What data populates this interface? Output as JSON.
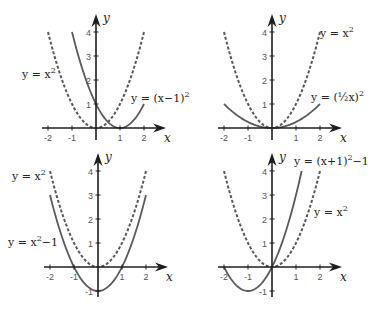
{
  "chart_data": [
    {
      "type": "line",
      "panel": "top-left",
      "origin_px": [
        96,
        128
      ],
      "unit_px": 24,
      "xlabel": "x",
      "ylabel": "y",
      "xlim": [
        -2,
        2
      ],
      "ylim": [
        0,
        4
      ],
      "x_ticks": [
        -2,
        -1,
        1,
        2
      ],
      "y_ticks": [
        1,
        2,
        3,
        4
      ],
      "series": [
        {
          "name": "y = x²",
          "style": "dashed",
          "expr": "x^2",
          "x_range": [
            -2,
            2
          ]
        },
        {
          "name": "y = (x−1)²",
          "style": "solid",
          "expr": "(x-1)^2",
          "x_range": [
            -1,
            2
          ]
        }
      ],
      "labels": [
        {
          "text": "y = x",
          "sup": "2",
          "x": 22,
          "y": 78
        },
        {
          "text": "y = (x−1)",
          "sup": "2",
          "x": 131,
          "y": 102
        }
      ]
    },
    {
      "type": "line",
      "panel": "top-right",
      "origin_px": [
        272,
        128
      ],
      "unit_px": 24,
      "xlabel": "x",
      "ylabel": "y",
      "xlim": [
        -2,
        2
      ],
      "ylim": [
        0,
        4
      ],
      "x_ticks": [
        -2,
        -1,
        1,
        2
      ],
      "y_ticks": [
        1,
        2,
        3,
        4
      ],
      "series": [
        {
          "name": "y = x²",
          "style": "dashed",
          "expr": "x^2",
          "x_range": [
            -2,
            2
          ]
        },
        {
          "name": "y = (½x)²",
          "style": "solid",
          "expr": "(0.5x)^2",
          "x_range": [
            -2,
            2
          ]
        }
      ],
      "labels": [
        {
          "text": "y = x",
          "sup": "2",
          "x": 320,
          "y": 37
        },
        {
          "text": "y = (½x)",
          "sup": "2",
          "x": 311,
          "y": 101
        }
      ]
    },
    {
      "type": "line",
      "panel": "bottom-left",
      "origin_px": [
        98,
        267
      ],
      "unit_px": 24,
      "xlabel": "x",
      "ylabel": "y",
      "xlim": [
        -2,
        2
      ],
      "ylim": [
        -1,
        4
      ],
      "x_ticks": [
        -2,
        -1,
        1,
        2
      ],
      "y_ticks": [
        -1,
        1,
        2,
        3,
        4
      ],
      "series": [
        {
          "name": "y = x²",
          "style": "dashed",
          "expr": "x^2",
          "x_range": [
            -2,
            2
          ]
        },
        {
          "name": "y = x²−1",
          "style": "solid",
          "expr": "x^2-1",
          "x_range": [
            -2,
            2
          ]
        }
      ],
      "labels": [
        {
          "text": "y = x",
          "sup": "2",
          "x": 12,
          "y": 180
        },
        {
          "text": "y = x",
          "sup": "2",
          "tail": "−1",
          "x": 8,
          "y": 246
        }
      ]
    },
    {
      "type": "line",
      "panel": "bottom-right",
      "origin_px": [
        272,
        267
      ],
      "unit_px": 24,
      "xlabel": "x",
      "ylabel": "y",
      "xlim": [
        -2,
        2
      ],
      "ylim": [
        -1,
        4
      ],
      "x_ticks": [
        -2,
        -1,
        1,
        2
      ],
      "y_ticks": [
        -1,
        1,
        2,
        3,
        4
      ],
      "series": [
        {
          "name": "y = x²",
          "style": "dashed",
          "expr": "x^2",
          "x_range": [
            -2,
            2
          ]
        },
        {
          "name": "y = (x+1)²−1",
          "style": "solid",
          "expr": "(x+1)^2-1",
          "x_range": [
            -2,
            1.236
          ]
        }
      ],
      "labels": [
        {
          "text": "y = (x+1)",
          "sup": "2",
          "tail": "−1",
          "x": 294,
          "y": 165
        },
        {
          "text": "y = x",
          "sup": "2",
          "x": 314,
          "y": 216
        }
      ]
    }
  ],
  "colors": {
    "axis": "#1e1e1e",
    "curve": "#5a5a5a",
    "tick_label": "#555555",
    "background": "#ffffff"
  }
}
